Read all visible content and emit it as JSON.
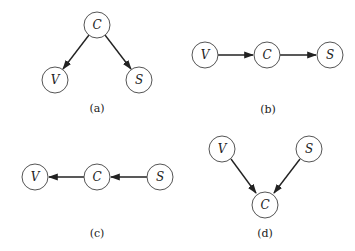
{
  "diagrams": [
    {
      "id": "a",
      "caption": "(a)",
      "nodes": [
        {
          "label": "C",
          "x": 97,
          "y": 25
        },
        {
          "label": "V",
          "x": 55,
          "y": 80
        },
        {
          "label": "S",
          "x": 139,
          "y": 80
        }
      ],
      "edges": [
        {
          "from": "C",
          "to": "V"
        },
        {
          "from": "C",
          "to": "S"
        }
      ]
    },
    {
      "id": "b",
      "caption": "(b)",
      "nodes": [
        {
          "label": "V",
          "x": 205,
          "y": 55
        },
        {
          "label": "C",
          "x": 267,
          "y": 55
        },
        {
          "label": "S",
          "x": 330,
          "y": 55
        }
      ],
      "edges": [
        {
          "from": "V",
          "to": "C"
        },
        {
          "from": "C",
          "to": "S"
        }
      ]
    },
    {
      "id": "c",
      "caption": "(c)",
      "nodes": [
        {
          "label": "V",
          "x": 35,
          "y": 177
        },
        {
          "label": "C",
          "x": 97,
          "y": 177
        },
        {
          "label": "S",
          "x": 160,
          "y": 177
        }
      ],
      "edges": [
        {
          "from": "C",
          "to": "V"
        },
        {
          "from": "S",
          "to": "C"
        }
      ]
    },
    {
      "id": "d",
      "caption": "(d)",
      "nodes": [
        {
          "label": "V",
          "x": 222,
          "y": 149
        },
        {
          "label": "S",
          "x": 309,
          "y": 149
        },
        {
          "label": "C",
          "x": 265,
          "y": 205
        }
      ],
      "edges": [
        {
          "from": "V",
          "to": "C"
        },
        {
          "from": "S",
          "to": "C"
        }
      ]
    }
  ],
  "captions": {
    "a": "(a)",
    "b": "(b)",
    "c": "(c)",
    "d": "(d)"
  },
  "colors": {
    "node_stroke": "#555555",
    "edge": "#222222",
    "text": "#222222"
  }
}
